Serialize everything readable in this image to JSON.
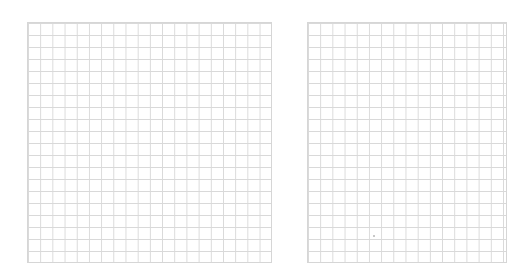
{
  "grids": [
    {
      "name": "left",
      "columns": 20,
      "rows": 20,
      "line_color": "#d9d9d9"
    },
    {
      "name": "right",
      "columns": 16,
      "rows": 20,
      "line_color": "#d9d9d9"
    }
  ]
}
